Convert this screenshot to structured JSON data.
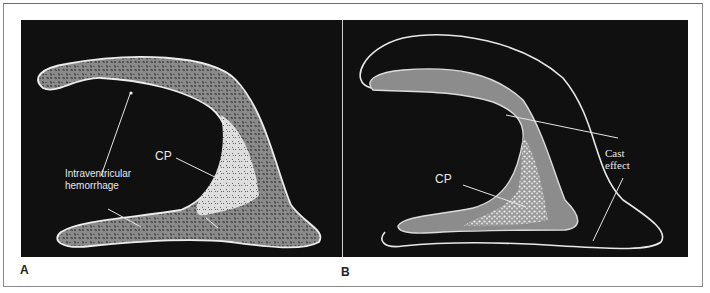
{
  "figure": {
    "panels": [
      {
        "id": "A",
        "label": "A",
        "annotations": {
          "ivh_line1": "Intraventricular",
          "ivh_line2": "hemorrhage",
          "cp": "CP"
        }
      },
      {
        "id": "B",
        "label": "B",
        "annotations": {
          "cp": "CP",
          "cast_line1": "Cast",
          "cast_line2": "effect"
        }
      }
    ],
    "colors": {
      "background": "#101010",
      "outline": "#e6e6e6",
      "hemorrhage_fill": "#7a7a7a",
      "choroid_plexus": "#d8d8d8"
    }
  }
}
